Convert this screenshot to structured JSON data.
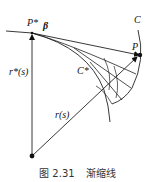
{
  "figure": {
    "labels": {
      "p_star": "P*",
      "beta": "β",
      "c": "C",
      "p": "P",
      "c_star": "C*",
      "r_star": "r*(s)",
      "r": "r(s)"
    },
    "caption": {
      "number": "图 2.31",
      "title": "渐缩线"
    },
    "colors": {
      "line": "#222222",
      "background": "#ffffff"
    }
  }
}
